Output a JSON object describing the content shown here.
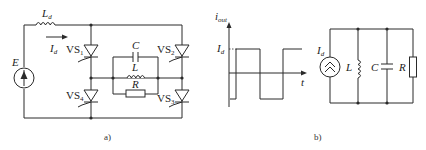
{
  "figure_a": {
    "caption": "a)",
    "labels": {
      "Ld": "L",
      "Ld_sub": "d",
      "Id": "I",
      "Id_sub": "d",
      "E": "E",
      "VS1": "VS",
      "VS1_sub": "1",
      "VS2": "VS",
      "VS2_sub": "2",
      "VS3": "VS",
      "VS3_sub": "3",
      "VS4": "VS",
      "VS4_sub": "4",
      "C": "C",
      "L": "L",
      "R": "R"
    }
  },
  "figure_b": {
    "caption": "b)",
    "waveform": {
      "ylabel": "i",
      "ylabel_sub": "out",
      "xlabel": "t",
      "level_label": "I",
      "level_sub": "d"
    },
    "circuit": {
      "source": "I",
      "source_sub": "d",
      "L": "L",
      "C": "C",
      "R": "R"
    }
  }
}
